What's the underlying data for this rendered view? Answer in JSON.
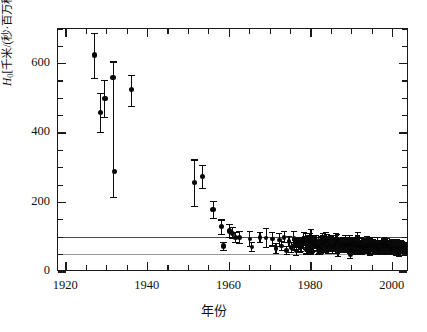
{
  "caption": {
    "top_strip_text": "—— ——— —— ———— ——— ———— —— ———"
  },
  "axes": {
    "y_title": "H₀[千米/(秒·百万秒差距)]",
    "y_title_main": "H",
    "y_title_sub": "0",
    "y_title_rest": "[千米/(秒·百万秒差距)]",
    "x_title": "年份",
    "y_ticks": [
      "0",
      "200",
      "400",
      "600"
    ],
    "x_ticks": [
      "1920",
      "1940",
      "1960",
      "1980",
      "2000"
    ]
  },
  "colors": {
    "axis": "#1a1a1a",
    "marker": "#050505",
    "refline_solid": "#4a4a4a",
    "refline_dotted": "#9a9a9a",
    "background": "#ffffff"
  },
  "chart_data": {
    "type": "scatter",
    "title": "",
    "subtitle": "",
    "xlabel": "年份",
    "ylabel": "H₀[千米/(秒·百万秒差距)]",
    "xlim": [
      1918,
      2004
    ],
    "ylim": [
      0,
      700
    ],
    "x_tick_values": [
      1920,
      1940,
      1960,
      1980,
      2000
    ],
    "y_tick_values": [
      0,
      200,
      400,
      600
    ],
    "x_minor_step": 5,
    "y_minor_step": 50,
    "grid": false,
    "legend": null,
    "error_bars": "vertical",
    "reference_lines": [
      {
        "name": "upper-reference-line",
        "y": 100,
        "style": "solid",
        "color": "#4a4a4a"
      },
      {
        "name": "lower-reference-line",
        "y": 50,
        "style": "dotted",
        "color": "#9a9a9a"
      }
    ],
    "points": [
      {
        "x": 1927.0,
        "y": 625,
        "yerr_low": 68,
        "yerr_high": 62
      },
      {
        "x": 1928.5,
        "y": 460,
        "yerr_low": 58,
        "yerr_high": 55
      },
      {
        "x": 1929.5,
        "y": 500,
        "yerr_low": 55,
        "yerr_high": 52
      },
      {
        "x": 1931.5,
        "y": 560,
        "yerr_low": 345,
        "yerr_high": 45
      },
      {
        "x": 1931.8,
        "y": 290,
        "yerr_low": 0,
        "yerr_high": 0
      },
      {
        "x": 1936.0,
        "y": 525,
        "yerr_low": 48,
        "yerr_high": 42
      },
      {
        "x": 1951.5,
        "y": 258,
        "yerr_low": 68,
        "yerr_high": 65
      },
      {
        "x": 1953.5,
        "y": 275,
        "yerr_low": 35,
        "yerr_high": 32
      },
      {
        "x": 1956.0,
        "y": 180,
        "yerr_low": 25,
        "yerr_high": 24
      },
      {
        "x": 1958.0,
        "y": 130,
        "yerr_low": 22,
        "yerr_high": 20
      },
      {
        "x": 1958.6,
        "y": 75,
        "yerr_low": 12,
        "yerr_high": 10
      },
      {
        "x": 1960.0,
        "y": 118,
        "yerr_low": 18,
        "yerr_high": 20
      },
      {
        "x": 1960.7,
        "y": 112,
        "yerr_low": 16,
        "yerr_high": 16
      },
      {
        "x": 1961.5,
        "y": 100,
        "yerr_low": 14,
        "yerr_high": 15
      },
      {
        "x": 1962.4,
        "y": 100,
        "yerr_low": 18,
        "yerr_high": 16
      },
      {
        "x": 1965.0,
        "y": 95,
        "yerr_low": 22,
        "yerr_high": 22
      },
      {
        "x": 1965.5,
        "y": 72,
        "yerr_low": 12,
        "yerr_high": 12
      },
      {
        "x": 1967.5,
        "y": 100,
        "yerr_low": 15,
        "yerr_high": 14
      },
      {
        "x": 1969.0,
        "y": 98,
        "yerr_low": 28,
        "yerr_high": 28
      },
      {
        "x": 1970.5,
        "y": 95,
        "yerr_low": 20,
        "yerr_high": 18
      },
      {
        "x": 1971.4,
        "y": 68,
        "yerr_low": 14,
        "yerr_high": 14
      },
      {
        "x": 1972.2,
        "y": 92,
        "yerr_low": 18,
        "yerr_high": 18
      },
      {
        "x": 1972.8,
        "y": 75,
        "yerr_low": 14,
        "yerr_high": 14
      },
      {
        "x": 1973.4,
        "y": 100,
        "yerr_low": 16,
        "yerr_high": 16
      },
      {
        "x": 1974.0,
        "y": 62,
        "yerr_low": 12,
        "yerr_high": 12
      },
      {
        "x": 1974.6,
        "y": 88,
        "yerr_low": 15,
        "yerr_high": 15
      },
      {
        "x": 1975.2,
        "y": 70,
        "yerr_low": 14,
        "yerr_high": 14
      },
      {
        "x": 1975.8,
        "y": 98,
        "yerr_low": 18,
        "yerr_high": 18
      },
      {
        "x": 1976.4,
        "y": 60,
        "yerr_low": 12,
        "yerr_high": 12
      },
      {
        "x": 1977.0,
        "y": 82,
        "yerr_low": 16,
        "yerr_high": 16
      },
      {
        "x": 1977.6,
        "y": 72,
        "yerr_low": 12,
        "yerr_high": 12
      },
      {
        "x": 1978.2,
        "y": 95,
        "yerr_low": 18,
        "yerr_high": 18
      },
      {
        "x": 1978.8,
        "y": 65,
        "yerr_low": 13,
        "yerr_high": 13
      },
      {
        "x": 1979.4,
        "y": 85,
        "yerr_low": 15,
        "yerr_high": 15
      },
      {
        "x": 1980.0,
        "y": 100,
        "yerr_low": 20,
        "yerr_high": 22
      },
      {
        "x": 1980.6,
        "y": 72,
        "yerr_low": 13,
        "yerr_high": 13
      },
      {
        "x": 1981.2,
        "y": 90,
        "yerr_low": 16,
        "yerr_high": 16
      },
      {
        "x": 1981.8,
        "y": 62,
        "yerr_low": 12,
        "yerr_high": 12
      },
      {
        "x": 1982.4,
        "y": 84,
        "yerr_low": 15,
        "yerr_high": 15
      },
      {
        "x": 1983.0,
        "y": 70,
        "yerr_low": 13,
        "yerr_high": 13
      },
      {
        "x": 1983.6,
        "y": 96,
        "yerr_low": 18,
        "yerr_high": 18
      },
      {
        "x": 1984.2,
        "y": 66,
        "yerr_low": 12,
        "yerr_high": 12
      },
      {
        "x": 1984.8,
        "y": 88,
        "yerr_low": 16,
        "yerr_high": 16
      },
      {
        "x": 1985.4,
        "y": 74,
        "yerr_low": 13,
        "yerr_high": 13
      },
      {
        "x": 1986.0,
        "y": 92,
        "yerr_low": 20,
        "yerr_high": 20
      },
      {
        "x": 1986.6,
        "y": 58,
        "yerr_low": 12,
        "yerr_high": 12
      },
      {
        "x": 1987.2,
        "y": 80,
        "yerr_low": 14,
        "yerr_high": 14
      },
      {
        "x": 1987.8,
        "y": 68,
        "yerr_low": 12,
        "yerr_high": 12
      },
      {
        "x": 1988.4,
        "y": 90,
        "yerr_low": 16,
        "yerr_high": 16
      },
      {
        "x": 1989.0,
        "y": 74,
        "yerr_low": 13,
        "yerr_high": 13
      },
      {
        "x": 1989.6,
        "y": 50,
        "yerr_low": 10,
        "yerr_high": 10
      },
      {
        "x": 1990.2,
        "y": 85,
        "yerr_low": 15,
        "yerr_high": 15
      },
      {
        "x": 1990.8,
        "y": 70,
        "yerr_low": 12,
        "yerr_high": 12
      },
      {
        "x": 1991.4,
        "y": 95,
        "yerr_low": 18,
        "yerr_high": 18
      },
      {
        "x": 1992.0,
        "y": 64,
        "yerr_low": 11,
        "yerr_high": 11
      },
      {
        "x": 1992.6,
        "y": 82,
        "yerr_low": 14,
        "yerr_high": 14
      },
      {
        "x": 1993.2,
        "y": 72,
        "yerr_low": 12,
        "yerr_high": 12
      },
      {
        "x": 1993.8,
        "y": 88,
        "yerr_low": 15,
        "yerr_high": 15
      },
      {
        "x": 1994.4,
        "y": 60,
        "yerr_low": 11,
        "yerr_high": 11
      },
      {
        "x": 1995.0,
        "y": 78,
        "yerr_low": 13,
        "yerr_high": 13
      },
      {
        "x": 1995.6,
        "y": 68,
        "yerr_low": 11,
        "yerr_high": 11
      },
      {
        "x": 1996.2,
        "y": 86,
        "yerr_low": 14,
        "yerr_high": 14
      },
      {
        "x": 1996.8,
        "y": 62,
        "yerr_low": 10,
        "yerr_high": 10
      },
      {
        "x": 1997.4,
        "y": 76,
        "yerr_low": 12,
        "yerr_high": 12
      },
      {
        "x": 1998.0,
        "y": 70,
        "yerr_low": 11,
        "yerr_high": 11
      },
      {
        "x": 1998.6,
        "y": 84,
        "yerr_low": 13,
        "yerr_high": 13
      },
      {
        "x": 1999.2,
        "y": 64,
        "yerr_low": 10,
        "yerr_high": 10
      },
      {
        "x": 1999.8,
        "y": 74,
        "yerr_low": 11,
        "yerr_high": 11
      },
      {
        "x": 2000.4,
        "y": 68,
        "yerr_low": 10,
        "yerr_high": 10
      },
      {
        "x": 2001.0,
        "y": 78,
        "yerr_low": 11,
        "yerr_high": 11
      },
      {
        "x": 2001.6,
        "y": 72,
        "yerr_low": 10,
        "yerr_high": 10
      },
      {
        "x": 2002.2,
        "y": 66,
        "yerr_low": 9,
        "yerr_high": 9
      },
      {
        "x": 2002.8,
        "y": 73,
        "yerr_low": 9,
        "yerr_high": 9
      }
    ],
    "dense_cluster": {
      "description": "High-density overlapping measurements after 1975",
      "x_range": [
        1975,
        2003
      ],
      "y_range": [
        45,
        110
      ],
      "count": 430
    }
  }
}
